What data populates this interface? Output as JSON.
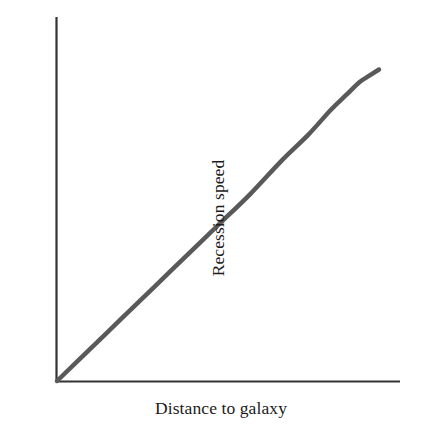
{
  "figure": {
    "background_color": "#ffffff",
    "axis_color": "#333333",
    "curve_color": "#595959"
  },
  "axes": {
    "x_label": "Distance to galaxy",
    "y_label": "Recession speed"
  },
  "chart_data": {
    "type": "line",
    "title": "",
    "subtitle": "",
    "xlabel": "Distance to galaxy",
    "ylabel": "Recession speed",
    "xlim": [
      0,
      1
    ],
    "ylim": [
      0,
      1
    ],
    "grid": false,
    "legend": null,
    "axis_ticks": {
      "x": [],
      "y": []
    },
    "annotations": [],
    "series": [
      {
        "name": "recession-speed-vs-distance",
        "color": "#595959",
        "line_width": 4.5,
        "x": [
          0.0,
          0.1,
          0.2,
          0.3,
          0.4,
          0.5,
          0.6,
          0.7,
          0.78,
          0.85,
          0.9,
          0.94,
          0.97,
          1.0
        ],
        "y": [
          0.0,
          0.1,
          0.2,
          0.3,
          0.4,
          0.5,
          0.6,
          0.71,
          0.79,
          0.87,
          0.92,
          0.96,
          0.98,
          1.0
        ]
      }
    ]
  }
}
